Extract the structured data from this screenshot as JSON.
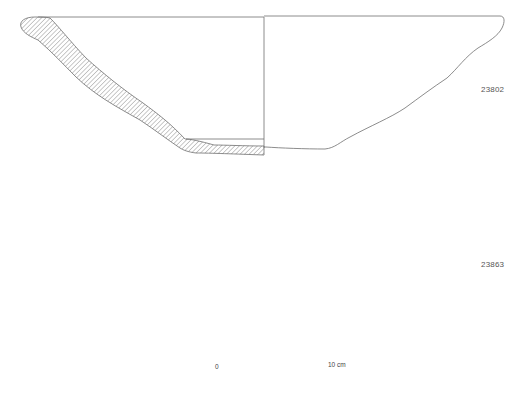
{
  "drawings": [
    {
      "id": "vessel-1",
      "catalog_number": "23802"
    },
    {
      "id": "vessel-2",
      "catalog_number": "23863"
    }
  ],
  "scale_bar": {
    "start_label": "0",
    "end_label": "10 cm",
    "segments": 10
  },
  "colors": {
    "line": "#6f6f6f",
    "hatch": "#7a7a7a",
    "scale_black": "#111111",
    "background": "#ffffff"
  }
}
